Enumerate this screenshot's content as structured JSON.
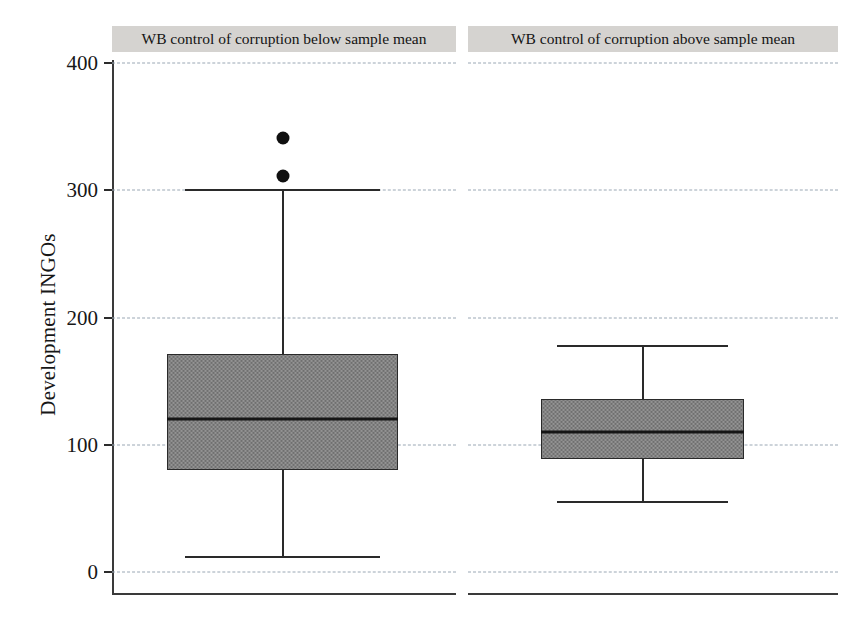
{
  "chart_data": {
    "type": "boxplot",
    "title": "",
    "xlabel": "",
    "ylabel": "Development INGOs",
    "ylim": [
      -25,
      430
    ],
    "yticks": [
      0,
      100,
      200,
      300,
      400
    ],
    "ytick_labels": [
      "0",
      "100",
      "200",
      "300",
      "400"
    ],
    "grid": true,
    "grid_axis": "y",
    "grid_style": "dashed",
    "legend": "none",
    "panels": [
      {
        "label": "WB control of corruption below sample mean",
        "box": {
          "whisker_low": 12,
          "q1": 80,
          "median": 120,
          "q3": 171,
          "whisker_high": 300,
          "outliers": [
            341,
            311
          ]
        }
      },
      {
        "label": "WB control of corruption above sample mean",
        "box": {
          "whisker_low": 55,
          "q1": 89,
          "median": 110,
          "q3": 136,
          "whisker_high": 178,
          "outliers": []
        }
      }
    ],
    "colors": {
      "box_fill": "#808080",
      "box_edge": "#2a2a2a",
      "median": "#151515",
      "whisker": "#2a2a2a",
      "outlier": "#101010",
      "grid": "#9aa7b4",
      "panel_header_bg": "#d5d3d0",
      "axis": "#3a3a3a",
      "text": "#171717"
    }
  }
}
